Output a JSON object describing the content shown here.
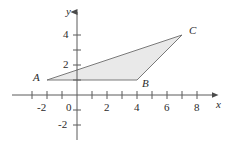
{
  "figure": {
    "title": "",
    "background_color": "#ffffff",
    "axis_color": "#5a5a5a",
    "shape_fill_color": "#e9e9e9",
    "shape_stroke_color": "#6b6b6b",
    "label_color": "#2b2b2b"
  },
  "axes": {
    "x_axis_name": "x",
    "y_axis_name": "y",
    "x_tick_labels": [
      "-2",
      "2",
      "4",
      "6",
      "8"
    ],
    "y_tick_labels": [
      "4",
      "2",
      "-2"
    ],
    "origin_label": "0",
    "x_range": [
      -3.5,
      9.2
    ],
    "y_range": [
      -3.0,
      5.0
    ],
    "x_ticks": [
      -3,
      -2,
      -1,
      1,
      2,
      3,
      4,
      5,
      6,
      7,
      8
    ],
    "y_ticks": [
      -2,
      -1,
      1,
      2,
      3,
      4
    ],
    "grid": false
  },
  "chart_data": {
    "type": "scatter",
    "title": "",
    "xlabel": "x",
    "ylabel": "y",
    "xlim": [
      -3.5,
      9.2
    ],
    "ylim": [
      -3.0,
      5.0
    ],
    "shapes": [
      {
        "name": "triangle-ABC",
        "vertices": [
          {
            "label": "A",
            "x": -2,
            "y": 1
          },
          {
            "label": "B",
            "x": 4,
            "y": 1
          },
          {
            "label": "C",
            "x": 7,
            "y": 4
          }
        ]
      }
    ]
  },
  "vertices": {
    "a_label": "A",
    "b_label": "B",
    "c_label": "C"
  }
}
